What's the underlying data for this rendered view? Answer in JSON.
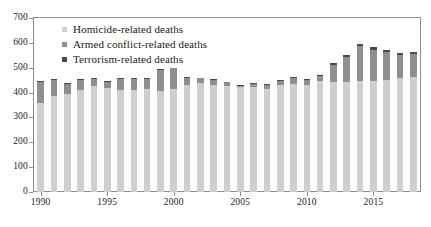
{
  "chart_data": {
    "type": "bar",
    "stacked": true,
    "title": "",
    "subtitle": "",
    "xlabel": "",
    "ylabel": "",
    "ylim": [
      0,
      700
    ],
    "ytick_step": 100,
    "yticks": [
      "0",
      "100",
      "200",
      "300",
      "400",
      "500",
      "600",
      "700"
    ],
    "grid": false,
    "legend_position": "top-left",
    "categories": [
      "1990",
      "1991",
      "1992",
      "1993",
      "1994",
      "1995",
      "1996",
      "1997",
      "1998",
      "1999",
      "2000",
      "2001",
      "2002",
      "2003",
      "2004",
      "2005",
      "2006",
      "2007",
      "2008",
      "2009",
      "2010",
      "2011",
      "2012",
      "2013",
      "2014",
      "2015",
      "2016",
      "2017",
      "2018"
    ],
    "xtick_labels": [
      "1990",
      "1995",
      "2000",
      "2005",
      "2010",
      "2015"
    ],
    "series": [
      {
        "name": "Homicide-related deaths",
        "color": "#cfcfcf",
        "values": [
          360,
          385,
          393,
          412,
          428,
          420,
          411,
          409,
          414,
          406,
          414,
          432,
          438,
          432,
          428,
          421,
          421,
          415,
          430,
          434,
          430,
          447,
          443,
          444,
          446,
          447,
          452,
          458,
          464
        ]
      },
      {
        "name": "Armed conflict-related deaths",
        "color": "#8f8f8f",
        "values": [
          83,
          66,
          43,
          40,
          27,
          24,
          44,
          46,
          40,
          84,
          83,
          26,
          19,
          19,
          13,
          7,
          15,
          17,
          17,
          25,
          21,
          19,
          70,
          101,
          140,
          126,
          113,
          93,
          92
        ]
      },
      {
        "name": "Terrorism-related deaths",
        "color": "#4a4a4a",
        "values": [
          2,
          3,
          3,
          3,
          3,
          3,
          3,
          3,
          3,
          3,
          3,
          3,
          3,
          3,
          3,
          3,
          3,
          3,
          3,
          4,
          4,
          3,
          6,
          8,
          9,
          9,
          8,
          7,
          7
        ]
      }
    ],
    "totals": [
      445,
      454,
      439,
      455,
      458,
      447,
      458,
      458,
      457,
      493,
      500,
      461,
      460,
      454,
      444,
      431,
      439,
      435,
      450,
      463,
      455,
      469,
      519,
      553,
      595,
      582,
      573,
      558,
      563
    ]
  },
  "legend": {
    "items": [
      {
        "label": "Homicide-related deaths",
        "color": "#cfcfcf"
      },
      {
        "label": "Armed conflict-related deaths",
        "color": "#8f8f8f"
      },
      {
        "label": "Terrorism-related deaths",
        "color": "#4a4a4a"
      }
    ]
  }
}
